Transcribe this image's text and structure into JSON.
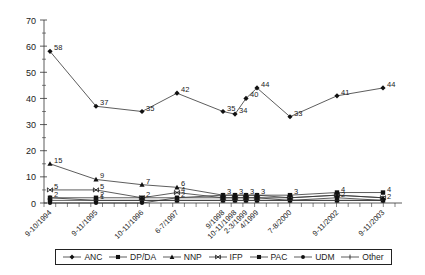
{
  "chart_data": {
    "type": "line",
    "title": "",
    "xlabel": "",
    "ylabel": "",
    "ylim": [
      0,
      70
    ],
    "yticks": [
      0,
      10,
      20,
      30,
      40,
      50,
      60,
      70
    ],
    "grid": false,
    "legend_position": "bottom",
    "categories": [
      "9-10/1994",
      "9-11/1995",
      "10-11/1996",
      "6-7/1997",
      "9/1998",
      "10-11/1998",
      "2-3/1999",
      "4/1999",
      "7-8/2000",
      "9-11/2002",
      "9-11/2003"
    ],
    "x_positions": [
      50,
      96,
      142,
      177,
      223,
      235,
      246,
      257,
      290,
      337,
      383
    ],
    "series": [
      {
        "name": "ANC",
        "marker": "diamond",
        "values": [
          58,
          37,
          35,
          42,
          35,
          34,
          40,
          44,
          33,
          41,
          44
        ]
      },
      {
        "name": "DP/DA",
        "marker": "square",
        "values": [
          2,
          2,
          2,
          2,
          3,
          3,
          3,
          3,
          3,
          4,
          4
        ]
      },
      {
        "name": "NNP",
        "marker": "triangle",
        "values": [
          15,
          9,
          7,
          6,
          3,
          3,
          3,
          3,
          2,
          3,
          2
        ]
      },
      {
        "name": "IFP",
        "marker": "bowtie",
        "values": [
          5,
          5,
          2,
          4,
          2,
          2,
          2,
          2,
          2,
          3,
          2
        ]
      },
      {
        "name": "PAC",
        "marker": "square",
        "values": [
          1,
          1,
          1,
          1,
          1,
          1,
          1,
          1,
          1,
          1,
          1
        ]
      },
      {
        "name": "UDM",
        "marker": "circle",
        "values": [
          0,
          0,
          0,
          2,
          2,
          2,
          2,
          2,
          1,
          2,
          1
        ]
      },
      {
        "name": "Other",
        "marker": "tick",
        "values": [
          2,
          1,
          1,
          1,
          1,
          1,
          1,
          1,
          1,
          1,
          1
        ]
      }
    ],
    "labels": [
      {
        "series": "ANC",
        "index": 0,
        "text": "58"
      },
      {
        "series": "ANC",
        "index": 1,
        "text": "37"
      },
      {
        "series": "ANC",
        "index": 2,
        "text": "35"
      },
      {
        "series": "ANC",
        "index": 3,
        "text": "42"
      },
      {
        "series": "ANC",
        "index": 4,
        "text": "35"
      },
      {
        "series": "ANC",
        "index": 5,
        "text": "34"
      },
      {
        "series": "ANC",
        "index": 6,
        "text": "40"
      },
      {
        "series": "ANC",
        "index": 7,
        "text": "44"
      },
      {
        "series": "ANC",
        "index": 8,
        "text": "33"
      },
      {
        "series": "ANC",
        "index": 9,
        "text": "41"
      },
      {
        "series": "ANC",
        "index": 10,
        "text": "44"
      },
      {
        "series": "NNP",
        "index": 0,
        "text": "15"
      },
      {
        "series": "NNP",
        "index": 1,
        "text": "9"
      },
      {
        "series": "NNP",
        "index": 2,
        "text": "7"
      },
      {
        "series": "NNP",
        "index": 3,
        "text": "6"
      },
      {
        "series": "IFP",
        "index": 0,
        "text": "5"
      },
      {
        "series": "IFP",
        "index": 1,
        "text": "5"
      },
      {
        "series": "IFP",
        "index": 2,
        "text": "2"
      },
      {
        "series": "IFP",
        "index": 3,
        "text": "4"
      },
      {
        "series": "DP/DA",
        "index": 0,
        "text": "2"
      },
      {
        "series": "DP/DA",
        "index": 1,
        "text": "2"
      },
      {
        "series": "DP/DA",
        "index": 3,
        "text": "2"
      },
      {
        "series": "DP/DA",
        "index": 4,
        "text": "3"
      },
      {
        "series": "DP/DA",
        "index": 5,
        "text": "3"
      },
      {
        "series": "DP/DA",
        "index": 6,
        "text": "3"
      },
      {
        "series": "DP/DA",
        "index": 7,
        "text": "3"
      },
      {
        "series": "DP/DA",
        "index": 8,
        "text": "3"
      },
      {
        "series": "DP/DA",
        "index": 9,
        "text": "4"
      },
      {
        "series": "DP/DA",
        "index": 10,
        "text": "4"
      },
      {
        "series": "UDM",
        "index": 9,
        "text": "2"
      },
      {
        "series": "UDM",
        "index": 10,
        "text": "2"
      },
      {
        "series": "Other",
        "index": 1,
        "text": "1"
      }
    ]
  },
  "legend": {
    "items": [
      {
        "label": "ANC",
        "marker": "diamond"
      },
      {
        "label": "DP/DA",
        "marker": "square"
      },
      {
        "label": "NNP",
        "marker": "triangle"
      },
      {
        "label": "IFP",
        "marker": "bowtie"
      },
      {
        "label": "PAC",
        "marker": "square"
      },
      {
        "label": "UDM",
        "marker": "circle"
      },
      {
        "label": "Other",
        "marker": "tick"
      }
    ]
  },
  "style": {
    "line_color": "#333333",
    "text_color": "#222222"
  }
}
